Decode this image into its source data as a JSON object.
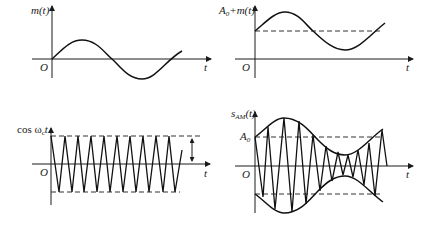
{
  "panels": [
    {
      "id": "message-signal",
      "y_label": "m(t)",
      "origin_label": "O",
      "x_label": "t",
      "description": "Message signal, one sinusoid cycle starting at origin"
    },
    {
      "id": "dc-plus-message",
      "y_label_main": "A",
      "y_label_sub": "0",
      "y_label_rest": "+m(t)",
      "origin_label": "O",
      "x_label": "t",
      "description": "Message signal shifted by DC offset A0 (dashed level)"
    },
    {
      "id": "carrier",
      "y_label_main": "cos ω",
      "y_label_sub": "c",
      "y_label_rest": "t",
      "origin_label": "O",
      "x_label": "t",
      "description": "High-frequency carrier with dashed amplitude bounds and double-headed amplitude arrow"
    },
    {
      "id": "am-signal",
      "y_label_main": "s",
      "y_label_sub": "AM",
      "y_label_rest": "(t)",
      "level_label_main": "A",
      "level_label_sub": "0",
      "origin_label": "O",
      "x_label": "t",
      "description": "AM waveform with envelope A0+m(t) and its mirror"
    }
  ],
  "colors": {
    "ink": "#111111",
    "background": "#ffffff",
    "dashed": "#333333"
  }
}
